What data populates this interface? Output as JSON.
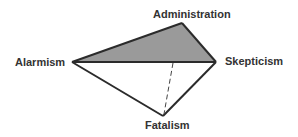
{
  "diagram": {
    "type": "quadrilateral-with-shaded-triangle",
    "nodes": [
      {
        "id": "administration",
        "label": "Administration",
        "x": 182,
        "y": 23
      },
      {
        "id": "alarmism",
        "label": "Alarmism",
        "x": 72,
        "y": 62
      },
      {
        "id": "skepticism",
        "label": "Skepticism",
        "x": 216,
        "y": 62
      },
      {
        "id": "fatalism",
        "label": "Fatalism",
        "x": 163,
        "y": 116
      }
    ],
    "edges": [
      {
        "from": "alarmism",
        "to": "administration",
        "style": "solid"
      },
      {
        "from": "administration",
        "to": "skepticism",
        "style": "solid"
      },
      {
        "from": "alarmism",
        "to": "skepticism",
        "style": "solid"
      },
      {
        "from": "alarmism",
        "to": "fatalism",
        "style": "solid"
      },
      {
        "from": "skepticism",
        "to": "fatalism",
        "style": "solid"
      },
      {
        "from": "alarmism-skepticism-midpoint",
        "to": "fatalism",
        "style": "dashed"
      }
    ],
    "shaded_region": [
      "alarmism",
      "administration",
      "skepticism"
    ],
    "colors": {
      "shade": "#9a9a9a",
      "stroke": "#2b2b2b",
      "text": "#333333"
    }
  }
}
